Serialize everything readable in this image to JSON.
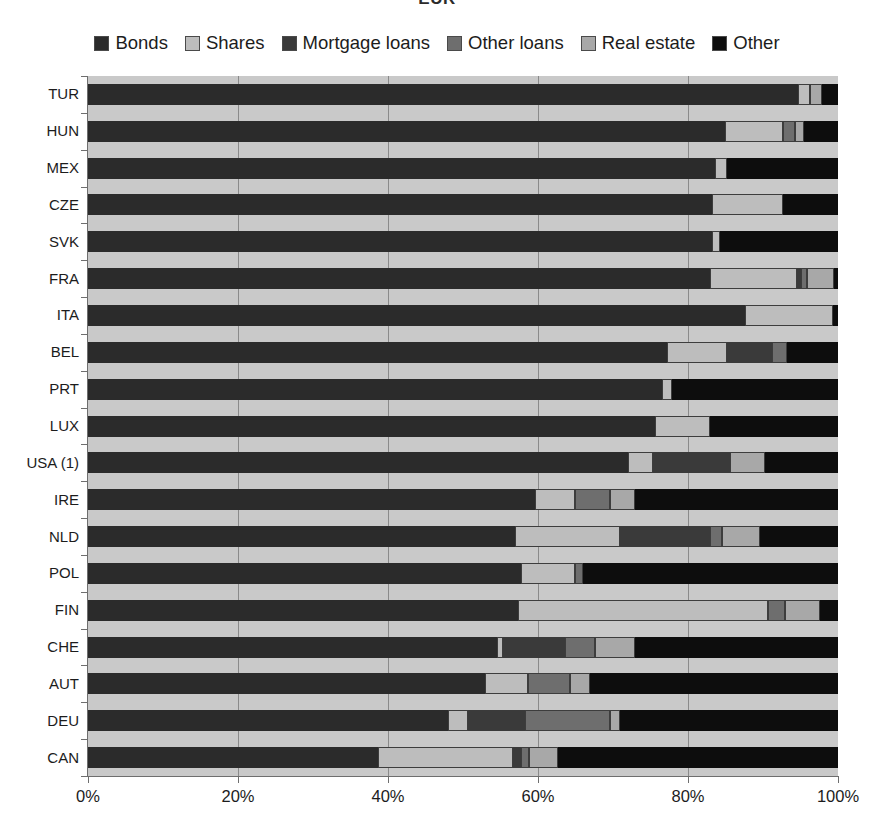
{
  "chart_data": {
    "type": "bar",
    "orientation": "horizontal",
    "stacked": true,
    "title": "EUR",
    "xlabel": "",
    "ylabel": "",
    "xlim": [
      0,
      100
    ],
    "xticks": [
      "0%",
      "20%",
      "40%",
      "60%",
      "80%",
      "100%"
    ],
    "xtick_values": [
      0,
      20,
      40,
      60,
      80,
      100
    ],
    "grid": true,
    "legend_position": "top",
    "categories": [
      "TUR",
      "HUN",
      "MEX",
      "CZE",
      "SVK",
      "FRA",
      "ITA",
      "BEL",
      "PRT",
      "LUX",
      "USA (1)",
      "IRE",
      "NLD",
      "POL",
      "FIN",
      "CHE",
      "AUT",
      "DEU",
      "CAN"
    ],
    "series": [
      {
        "name": "Bonds",
        "color": "#2b2b2b",
        "values": [
          94.7,
          84.9,
          83.6,
          83.2,
          83.2,
          82.9,
          87.6,
          77.2,
          76.5,
          75.6,
          72.0,
          59.6,
          56.9,
          57.7,
          57.3,
          54.5,
          52.9,
          48.0,
          38.7
        ]
      },
      {
        "name": "Shares",
        "color": "#bdbdbd",
        "values": [
          1.6,
          7.7,
          1.6,
          9.5,
          1.1,
          11.6,
          11.7,
          8.0,
          1.3,
          7.3,
          3.3,
          5.3,
          14.0,
          7.2,
          33.3,
          0.8,
          5.7,
          2.7,
          17.9
        ]
      },
      {
        "name": "Mortgage loans",
        "color": "#3a3a3a",
        "values": [
          0.0,
          0.0,
          0.0,
          0.0,
          0.0,
          0.5,
          0.0,
          6.0,
          0.0,
          0.0,
          10.3,
          0.0,
          12.0,
          0.0,
          0.0,
          8.3,
          0.0,
          7.6,
          1.1
        ]
      },
      {
        "name": "Other loans",
        "color": "#6e6e6e",
        "values": [
          0.0,
          1.6,
          0.0,
          0.0,
          0.0,
          0.8,
          0.0,
          2.0,
          0.0,
          0.0,
          0.0,
          4.7,
          1.6,
          1.1,
          2.3,
          4.0,
          5.6,
          11.3,
          1.1
        ]
      },
      {
        "name": "Real estate",
        "color": "#a8a8a8",
        "values": [
          1.6,
          1.3,
          0.0,
          0.0,
          0.0,
          3.6,
          0.0,
          0.0,
          0.0,
          0.0,
          4.7,
          3.3,
          5.1,
          0.0,
          4.7,
          5.3,
          2.7,
          1.3,
          3.9
        ]
      },
      {
        "name": "Other",
        "color": "#0d0d0d",
        "values": [
          2.1,
          4.5,
          14.8,
          7.3,
          15.7,
          0.6,
          0.7,
          6.8,
          22.2,
          17.1,
          9.7,
          27.1,
          10.4,
          34.0,
          2.4,
          27.1,
          33.1,
          29.1,
          37.3
        ]
      }
    ]
  },
  "legend": {
    "items": [
      {
        "label": "Bonds",
        "swatch": "#2b2b2b"
      },
      {
        "label": "Shares",
        "swatch": "#bdbdbd"
      },
      {
        "label": "Mortgage loans",
        "swatch": "#3a3a3a"
      },
      {
        "label": "Other loans",
        "swatch": "#6e6e6e"
      },
      {
        "label": "Real estate",
        "swatch": "#a8a8a8"
      },
      {
        "label": "Other",
        "swatch": "#0d0d0d"
      }
    ]
  }
}
